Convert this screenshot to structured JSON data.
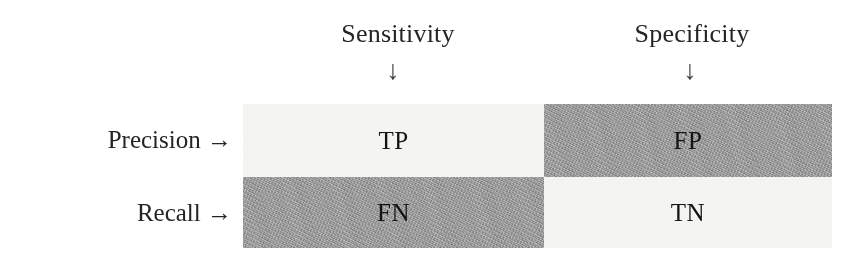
{
  "figure": {
    "colors": {
      "cell_dark": "#9a9a9a",
      "cell_light": "#f4f4f2",
      "text": "#141414",
      "label_text": "#242424",
      "background": "#ffffff"
    }
  },
  "column_headers": [
    {
      "label": "Sensitivity",
      "arrow": "↓",
      "arrow_name": "down-arrow"
    },
    {
      "label": "Specificity",
      "arrow": "↓",
      "arrow_name": "down-arrow"
    }
  ],
  "row_labels": [
    {
      "label": "Precision →",
      "name": "precision"
    },
    {
      "label": "Recall →",
      "name": "recall"
    }
  ],
  "matrix": {
    "rows": [
      [
        {
          "label": "TP",
          "name": "true-positive",
          "shade": "light"
        },
        {
          "label": "FP",
          "name": "false-positive",
          "shade": "dark"
        }
      ],
      [
        {
          "label": "FN",
          "name": "false-negative",
          "shade": "dark"
        },
        {
          "label": "TN",
          "name": "true-negative",
          "shade": "light"
        }
      ]
    ]
  }
}
